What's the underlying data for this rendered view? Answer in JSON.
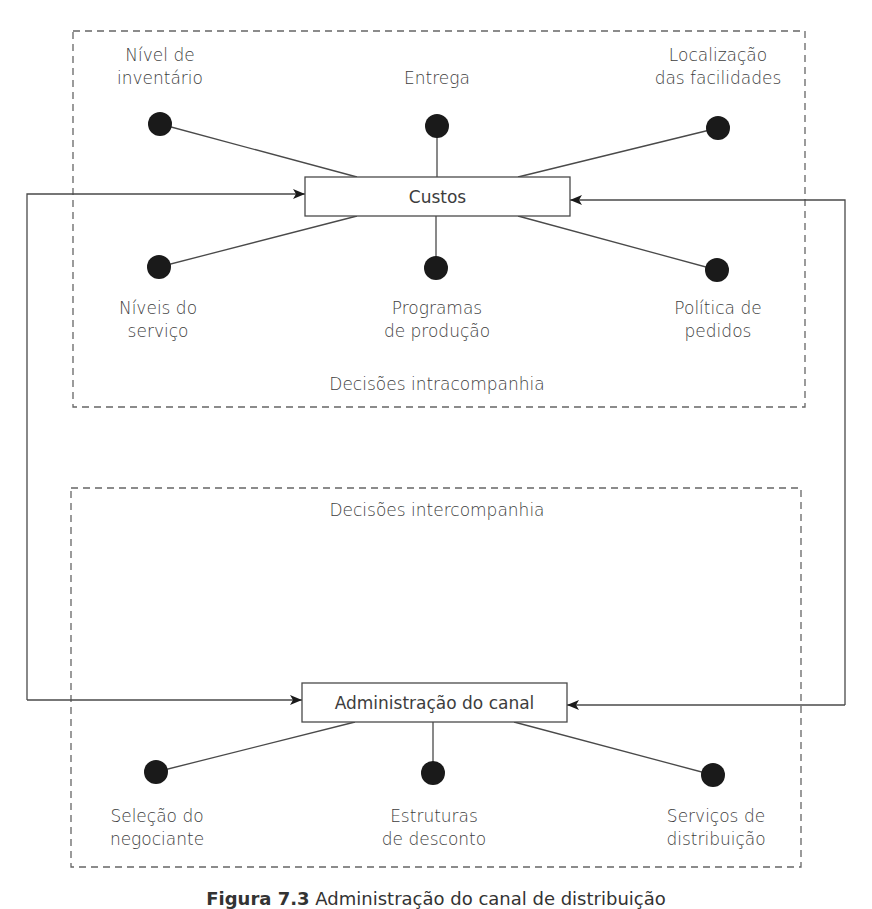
{
  "diagram": {
    "intra_group": {
      "label": "Decisões intracompanhia",
      "hub": "Custos",
      "nodes": [
        {
          "id": "inventario",
          "label": "Nível de\ninventário"
        },
        {
          "id": "entrega",
          "label": "Entrega"
        },
        {
          "id": "localizacao",
          "label": "Localização\ndas facilidades"
        },
        {
          "id": "servico",
          "label": "Níveis do\nserviço"
        },
        {
          "id": "producao",
          "label": "Programas\nde produção"
        },
        {
          "id": "pedidos",
          "label": "Política de\npedidos"
        }
      ]
    },
    "inter_group": {
      "label": "Decisões intercompanhia",
      "hub": "Administração do canal",
      "nodes": [
        {
          "id": "negociante",
          "label": "Seleção do\nnegociante"
        },
        {
          "id": "desconto",
          "label": "Estruturas\nde desconto"
        },
        {
          "id": "distribuicao",
          "label": "Serviços de\ndistribuição"
        }
      ]
    },
    "feedback_arrows": [
      "Custos ↔ Administração do canal (left loop)",
      "Custos ↔ Administração do canal (right loop)"
    ]
  },
  "caption": {
    "figure": "Figura 7.3",
    "text": "Administração do canal de distribuição"
  },
  "colors": {
    "line": "#4a4a4a",
    "dot": "#1a1a1a",
    "dash": "#666666",
    "text": "#3d3d3d"
  }
}
